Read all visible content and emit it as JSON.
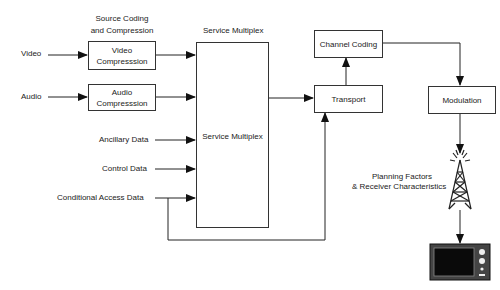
{
  "diagram": {
    "inputs": {
      "video": "Video",
      "audio": "Audio",
      "ancillary": "Ancillary Data",
      "control": "Control Data",
      "conditional_access": "Conditional Access Data"
    },
    "headers": {
      "source_coding_line1": "Source Coding",
      "source_coding_line2": "and Compression",
      "service_multiplex": "Service Multiplex"
    },
    "boxes": {
      "video_compression_line1": "Video",
      "video_compression_line2": "Compresssion",
      "audio_compression_line1": "Audio",
      "audio_compression_line2": "Compresssion",
      "service_multiplex": "Service Multiplex",
      "channel_coding": "Channel Coding",
      "transport": "Transport",
      "modulation": "Modulation"
    },
    "annotations": {
      "planning_line1": "Planning Factors",
      "planning_line2": "& Receiver Characteristics"
    },
    "icons": {
      "transmitter": "transmitter-tower-icon",
      "receiver": "television-icon"
    },
    "colors": {
      "line": "#222222",
      "box_border": "#333333",
      "background": "#ffffff"
    }
  }
}
